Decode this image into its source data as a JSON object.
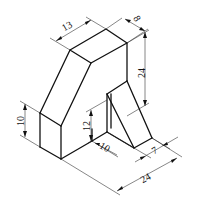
{
  "figure": {
    "type": "isometric-technical-drawing",
    "units": "unlabeled",
    "background": "#ffffff",
    "line_color": "#111111"
  },
  "dimensions": {
    "top_depth": "13",
    "top_width": "8",
    "right_height": "24",
    "left_height": "10",
    "step_height": "12",
    "step_depth": "10",
    "rib_width": "7",
    "base_width": "24"
  }
}
